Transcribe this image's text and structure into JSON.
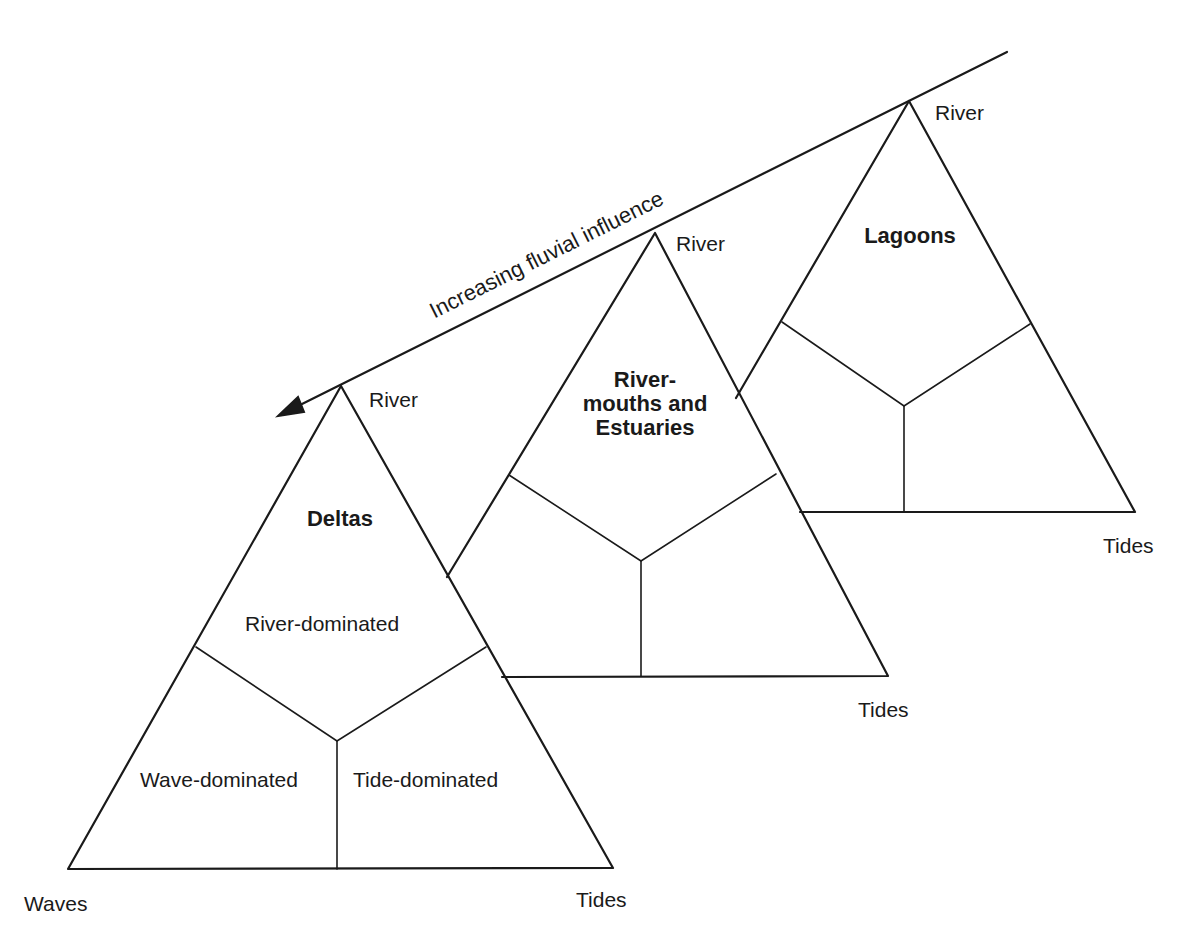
{
  "arrow": {
    "label": "Increasing fluvial influence",
    "from": [
      1007,
      52
    ],
    "to": [
      278,
      416
    ]
  },
  "triangles": [
    {
      "id": "deltas",
      "title": "Deltas",
      "apex_label": "River",
      "left_label": "Waves",
      "right_label": "Tides",
      "regions": {
        "top": "River-dominated",
        "left": "Wave-dominated",
        "right": "Tide-dominated"
      }
    },
    {
      "id": "rivermouths",
      "title": "River-\nmouths and\nEstuaries",
      "apex_label": "River",
      "right_label": "Tides"
    },
    {
      "id": "lagoons",
      "title": "Lagoons",
      "apex_label": "River",
      "right_label": "Tides"
    }
  ],
  "colors": {
    "line": "#1a1a1a",
    "background": "#ffffff"
  }
}
